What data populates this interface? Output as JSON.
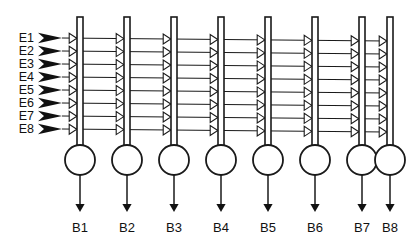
{
  "diagram": {
    "type": "neural-network-schematic",
    "title": "",
    "background_color": "#ffffff",
    "line_color": "#1a1a1a",
    "inputs": {
      "count": 8,
      "orientation": "left",
      "marker": "solid-arrow-icon",
      "labels": [
        "E1",
        "E2",
        "E3",
        "E4",
        "E5",
        "E6",
        "E7",
        "E8"
      ],
      "y_positions": [
        38,
        51,
        64,
        77,
        90,
        103,
        116,
        129
      ],
      "label_x": 34,
      "arrow_x_start": 38,
      "arrow_x_end": 62
    },
    "columns": {
      "count": 8,
      "labels": [
        "B1",
        "B2",
        "B3",
        "B4",
        "B5",
        "B6",
        "B7",
        "B8"
      ],
      "x_positions": [
        80,
        127,
        174,
        221,
        268,
        315,
        362,
        390
      ],
      "dendrite_top_y": 17,
      "dendrite_width": 6,
      "soma_center_y": 160,
      "soma_radius": 15,
      "output_arrow_top_y": 175,
      "output_arrow_bottom_y": 212,
      "output_label_y": 232
    },
    "synapses": {
      "per_column": 8,
      "total": 64,
      "marker": "triangle-synapse-icon",
      "orientation": "left-pointing"
    },
    "legend": {
      "input_label_prefix": "E",
      "output_label_prefix": "B"
    }
  }
}
